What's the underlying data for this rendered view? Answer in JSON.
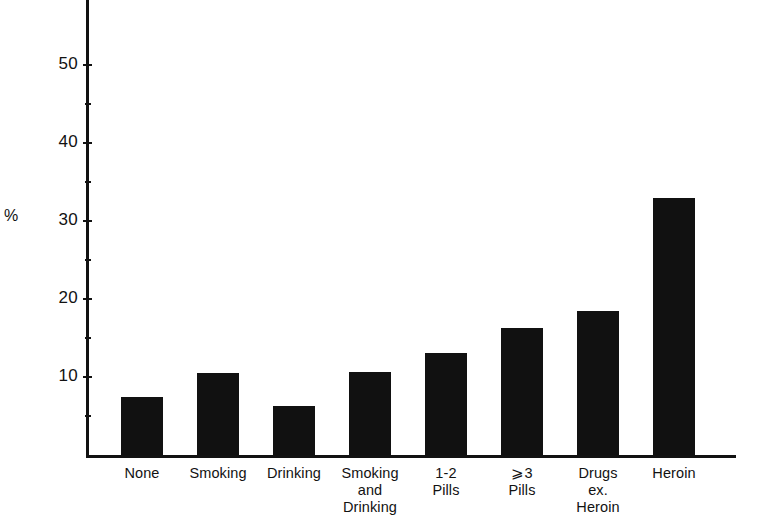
{
  "axis": {
    "unit_label": "%",
    "y_ticks_major": [
      "10",
      "20",
      "30",
      "40",
      "50"
    ],
    "y_ticks_minor": [
      "5",
      "15",
      "25",
      "35",
      "45"
    ]
  },
  "categories": [
    {
      "lines": [
        "None"
      ]
    },
    {
      "lines": [
        "Smoking"
      ]
    },
    {
      "lines": [
        "Drinking"
      ]
    },
    {
      "lines": [
        "Smoking",
        "and",
        "Drinking"
      ]
    },
    {
      "lines": [
        "1-2",
        "Pills"
      ]
    },
    {
      "lines": [
        "⩾3",
        "Pills"
      ]
    },
    {
      "lines": [
        "Drugs",
        "ex.",
        "Heroin"
      ]
    },
    {
      "lines": [
        "Heroin"
      ]
    }
  ],
  "chart_data": {
    "type": "bar",
    "title": "",
    "xlabel": "",
    "ylabel": "%",
    "categories": [
      "None",
      "Smoking",
      "Drinking",
      "Smoking and Drinking",
      "1-2 Pills",
      "⩾3 Pills",
      "Drugs ex. Heroin",
      "Heroin"
    ],
    "values": [
      7.5,
      10.5,
      6.3,
      10.6,
      13.1,
      16.3,
      18.5,
      33.0
    ],
    "ylim": [
      0,
      55
    ],
    "ytick_major_step": 10,
    "ytick_minor_step": 5,
    "grid": false,
    "legend": false,
    "bar_color": "#111111",
    "axis_color": "#121212",
    "background": "#ffffff"
  },
  "geometry": {
    "plot_left": 86,
    "baseline_y": 455,
    "px_per_unit": 7.8,
    "bar_width": 42,
    "bar_step": 76,
    "first_bar_left": 121
  }
}
